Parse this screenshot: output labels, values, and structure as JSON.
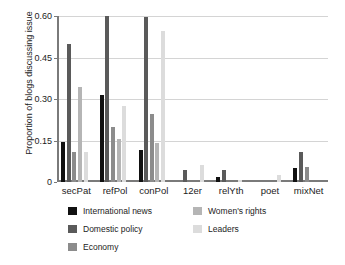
{
  "chart_data": {
    "type": "bar",
    "title": "",
    "xlabel": "",
    "ylabel": "Proportion of blogs discussing issue",
    "ylim": [
      0,
      0.6
    ],
    "yticks": [
      0,
      0.15,
      0.3,
      0.45,
      0.6
    ],
    "ytick_labels": [
      "0",
      "0.15",
      "0.30",
      "0.45",
      "0.60"
    ],
    "grid": true,
    "legend_position": "below",
    "categories": [
      "secPat",
      "refPol",
      "conPol",
      "12er",
      "relYth",
      "poet",
      "mixNet"
    ],
    "series": [
      {
        "name": "International news",
        "color": "#111111",
        "values": [
          0.143,
          0.315,
          0.115,
          0.0,
          0.018,
          0.0,
          0.052
        ]
      },
      {
        "name": "Domestic policy",
        "color": "#5a5a5a",
        "values": [
          0.5,
          0.6,
          0.595,
          0.045,
          0.045,
          0.0,
          0.11
        ]
      },
      {
        "name": "Economy",
        "color": "#8c8c8c",
        "values": [
          0.108,
          0.2,
          0.245,
          0.0,
          0.0,
          0.0,
          0.055
        ]
      },
      {
        "name": "Women's rights",
        "color": "#b5b5b5",
        "values": [
          0.345,
          0.155,
          0.14,
          0.0,
          0.0,
          0.0,
          0.0
        ]
      },
      {
        "name": "Leaders",
        "color": "#dcdcdc",
        "values": [
          0.108,
          0.275,
          0.545,
          0.063,
          0.008,
          0.025,
          0.0
        ]
      }
    ]
  },
  "axis": {
    "ylabel": "Proportion of blogs discussing issue"
  },
  "legend": {
    "left_column": [
      {
        "label": "International news",
        "color": "#111111"
      },
      {
        "label": "Domestic policy",
        "color": "#5a5a5a"
      },
      {
        "label": "Economy",
        "color": "#8c8c8c"
      }
    ],
    "right_column": [
      {
        "label": "Women's rights",
        "color": "#b5b5b5"
      },
      {
        "label": "Leaders",
        "color": "#dcdcdc"
      }
    ]
  }
}
